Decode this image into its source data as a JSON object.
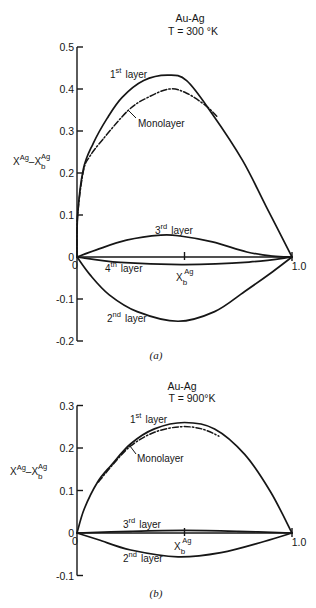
{
  "figure": {
    "panels": [
      {
        "id": "a",
        "system": "Au-Ag",
        "temperature": "T = 300 °K",
        "caption": "(a)",
        "ylabel": {
          "base": "X",
          "sup": "Ag",
          "sep": "–",
          "base2": "X",
          "sub": "b",
          "sup2": "Ag"
        },
        "xlabel": {
          "base": "X",
          "sub": "b",
          "sup": "Ag"
        },
        "x_tick_labels": {
          "start": "0",
          "end": "1.0"
        },
        "labels": {
          "first": {
            "n": "1",
            "sup": "st",
            "word": "layer"
          },
          "mono": "Monolayer",
          "third": {
            "n": "3",
            "sup": "rd",
            "word": "layer"
          },
          "fourth": {
            "n": "4",
            "sup": "th",
            "word": "layer"
          },
          "second": {
            "n": "2",
            "sup": "nd",
            "word": "layer"
          }
        }
      },
      {
        "id": "b",
        "system": "Au-Ag",
        "temperature": "T = 900°K",
        "caption": "(b)",
        "ylabel": {
          "base": "X",
          "sup": "Ag",
          "sep": "–",
          "base2": "X",
          "sub": "b",
          "sup2": "Ag"
        },
        "xlabel": {
          "base": "X",
          "sub": "b",
          "sup": "Ag"
        },
        "x_tick_labels": {
          "start": "0",
          "end": "1.0"
        },
        "labels": {
          "first": {
            "n": "1",
            "sup": "st",
            "word": "layer"
          },
          "mono": "Monolayer",
          "third": {
            "n": "3",
            "sup": "rd",
            "word": "layer"
          },
          "second": {
            "n": "2",
            "sup": "nd",
            "word": "layer"
          }
        }
      }
    ]
  },
  "chart_data": [
    {
      "type": "line",
      "title": "Au-Ag, T = 300 °K",
      "panel": "(a)",
      "xlabel": "X_b^Ag",
      "ylabel": "X^Ag − X_b^Ag",
      "xlim": [
        0,
        1.0
      ],
      "ylim": [
        -0.2,
        0.5
      ],
      "yticks": [
        0.5,
        0.4,
        0.3,
        0.2,
        0.1,
        0,
        -0.1,
        -0.2
      ],
      "ytick_labels": [
        "0.5",
        "0.4",
        "0.3",
        "0.2",
        "0.1",
        "0",
        "-0.1",
        "-0.2"
      ],
      "xticks": [
        0,
        0.5,
        1.0
      ],
      "grid": false,
      "legend": "inline labels",
      "series": [
        {
          "name": "1st layer",
          "style": "solid",
          "x": [
            0,
            0.003,
            0.03,
            0.075,
            0.14,
            0.21,
            0.31,
            0.42,
            0.51,
            0.63,
            0.77,
            0.88,
            1.0
          ],
          "y": [
            0,
            0.1,
            0.21,
            0.27,
            0.33,
            0.38,
            0.42,
            0.433,
            0.42,
            0.34,
            0.23,
            0.12,
            0
          ]
        },
        {
          "name": "Monolayer",
          "style": "dash-dot",
          "x": [
            0,
            0.003,
            0.03,
            0.06,
            0.12,
            0.24,
            0.33,
            0.43,
            0.51,
            0.6,
            0.65
          ],
          "y": [
            0,
            0.1,
            0.205,
            0.24,
            0.28,
            0.35,
            0.38,
            0.4,
            0.39,
            0.36,
            0.335
          ]
        },
        {
          "name": "3rd layer",
          "style": "solid",
          "x": [
            0,
            0.09,
            0.23,
            0.39,
            0.48,
            0.63,
            0.79,
            0.91,
            1.0
          ],
          "y": [
            0,
            0.017,
            0.04,
            0.052,
            0.05,
            0.036,
            0.012,
            0.002,
            0
          ]
        },
        {
          "name": "4th layer",
          "style": "solid",
          "x": [
            0,
            0.2,
            0.5,
            0.8,
            1.0
          ],
          "y": [
            0,
            -0.013,
            -0.018,
            -0.012,
            0
          ]
        },
        {
          "name": "2nd layer",
          "style": "solid",
          "x": [
            0,
            0.06,
            0.15,
            0.28,
            0.47,
            0.64,
            0.78,
            0.91,
            1.0
          ],
          "y": [
            0,
            -0.042,
            -0.09,
            -0.13,
            -0.153,
            -0.13,
            -0.082,
            -0.035,
            0
          ]
        }
      ]
    },
    {
      "type": "line",
      "title": "Au-Ag, T = 900 °K",
      "panel": "(b)",
      "xlabel": "X_b^Ag",
      "ylabel": "X^Ag − X_b^Ag",
      "xlim": [
        0,
        1.0
      ],
      "ylim": [
        -0.1,
        0.3
      ],
      "yticks": [
        0.3,
        0.2,
        0.1,
        0,
        -0.1
      ],
      "ytick_labels": [
        "0.3",
        "0.2",
        "0.1",
        "0",
        "-0.1"
      ],
      "xticks": [
        0,
        0.5,
        1.0
      ],
      "grid": false,
      "legend": "inline labels",
      "series": [
        {
          "name": "1st layer",
          "style": "solid",
          "x": [
            0,
            0.034,
            0.096,
            0.16,
            0.25,
            0.36,
            0.5,
            0.64,
            0.78,
            0.9,
            1.0
          ],
          "y": [
            0,
            0.057,
            0.12,
            0.16,
            0.21,
            0.245,
            0.26,
            0.245,
            0.185,
            0.097,
            0
          ]
        },
        {
          "name": "Monolayer",
          "style": "dash-dot",
          "x": [
            0.1,
            0.16,
            0.25,
            0.36,
            0.48,
            0.58,
            0.66
          ],
          "y": [
            0.12,
            0.157,
            0.205,
            0.237,
            0.25,
            0.245,
            0.228
          ]
        },
        {
          "name": "3rd layer",
          "style": "solid",
          "x": [
            0,
            0.25,
            0.5,
            0.75,
            1.0
          ],
          "y": [
            0,
            0.004,
            0.006,
            0.004,
            0
          ]
        },
        {
          "name": "2nd layer",
          "style": "solid",
          "x": [
            0,
            0.1,
            0.25,
            0.47,
            0.67,
            0.87,
            1.0
          ],
          "y": [
            0,
            -0.016,
            -0.04,
            -0.056,
            -0.046,
            -0.02,
            0
          ]
        }
      ]
    }
  ]
}
